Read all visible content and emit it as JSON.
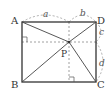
{
  "diagram": {
    "type": "geometry",
    "shape": "rectangle with interior point P",
    "vertices": [
      {
        "name": "A",
        "label": "A",
        "x": 22,
        "y": 22
      },
      {
        "name": "D",
        "label": "D",
        "x": 96,
        "y": 22
      },
      {
        "name": "B",
        "label": "B",
        "x": 22,
        "y": 82
      },
      {
        "name": "C",
        "label": "C",
        "x": 96,
        "y": 82
      }
    ],
    "point": {
      "name": "P",
      "label": "P",
      "x": 69,
      "y": 42
    },
    "segments": [
      "AD",
      "DC",
      "CB",
      "BA",
      "PA",
      "PB",
      "PC",
      "PD"
    ],
    "dashed": [
      "horizontal through P",
      "vertical through P"
    ],
    "right_angle_marks": [
      "left side at P height",
      "bottom side at P x"
    ],
    "measures": [
      {
        "label": "a",
        "from": "A",
        "to": "foot of P on AD"
      },
      {
        "label": "b",
        "from": "foot of P on AD",
        "to": "D"
      },
      {
        "label": "c",
        "from": "D",
        "to": "foot of P on DC"
      },
      {
        "label": "d",
        "from": "foot of P on DC",
        "to": "C"
      }
    ],
    "colors": {
      "lines": "#333333",
      "dashed": "#888888"
    }
  }
}
